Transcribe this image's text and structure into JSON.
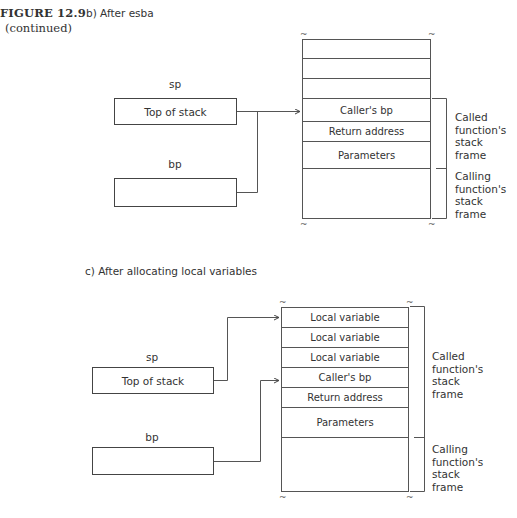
{
  "figure": {
    "label": "FIGURE 12.9",
    "continued": "(continued)"
  },
  "diagram_b": {
    "caption": "b) After esba",
    "registers": {
      "sp": {
        "label": "sp",
        "value": "Top of stack"
      },
      "bp": {
        "label": "bp",
        "value": ""
      }
    },
    "stack_rows": [
      "",
      "",
      "",
      "Caller's bp",
      "Return address",
      "Parameters",
      ""
    ],
    "brackets": {
      "called": [
        "Called",
        "function's",
        "stack",
        "frame"
      ],
      "calling": [
        "Calling",
        "function's",
        "stack",
        "frame"
      ]
    },
    "tilde": "~"
  },
  "diagram_c": {
    "caption": "c) After allocating local variables",
    "registers": {
      "sp": {
        "label": "sp",
        "value": "Top of stack"
      },
      "bp": {
        "label": "bp",
        "value": ""
      }
    },
    "stack_rows": [
      "Local variable",
      "Local variable",
      "Local variable",
      "Caller's bp",
      "Return address",
      "Parameters",
      ""
    ],
    "brackets": {
      "called": [
        "Called",
        "function's",
        "stack",
        "frame"
      ],
      "calling": [
        "Calling",
        "function's",
        "stack",
        "frame"
      ]
    },
    "tilde": "~"
  },
  "colors": {
    "line": "#555555",
    "text": "#333333",
    "background": "#ffffff"
  }
}
